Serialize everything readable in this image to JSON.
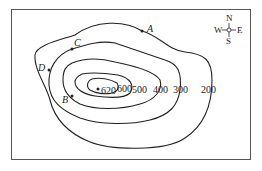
{
  "map": {
    "type": "contour-map",
    "contours": [
      {
        "value": "620",
        "label": "620"
      },
      {
        "value": "600",
        "label": "600"
      },
      {
        "value": "500",
        "label": "500"
      },
      {
        "value": "400",
        "label": "400"
      },
      {
        "value": "300",
        "label": "300"
      },
      {
        "value": "200",
        "label": "200"
      }
    ],
    "summit": {
      "label": "620"
    },
    "points": [
      {
        "name": "A"
      },
      {
        "name": "B"
      },
      {
        "name": "C"
      },
      {
        "name": "D"
      }
    ],
    "compass": {
      "n": "N",
      "s": "S",
      "e": "E",
      "w": "W"
    }
  }
}
